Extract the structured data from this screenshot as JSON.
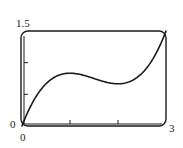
{
  "chart_data": {
    "type": "line",
    "title": "",
    "xlabel": "",
    "ylabel": "",
    "xlim": [
      0,
      3
    ],
    "ylim": [
      0,
      1.5
    ],
    "grid": false,
    "legend": null,
    "x_tick_labels": [
      "0",
      "3"
    ],
    "y_tick_labels": [
      "0",
      "1.5"
    ],
    "x_ticks": [
      1,
      2
    ],
    "y_ticks": [
      0.5,
      1.0
    ],
    "series": [
      {
        "name": "y = x^3/3 - 1.5x^2 + 2x",
        "x": [
          0,
          0.25,
          0.5,
          0.75,
          1.0,
          1.25,
          1.5,
          1.75,
          2.0,
          2.25,
          2.5,
          2.75,
          3.0
        ],
        "y": [
          0,
          0.411,
          0.667,
          0.797,
          0.833,
          0.807,
          0.75,
          0.693,
          0.667,
          0.703,
          0.833,
          1.089,
          1.5
        ]
      }
    ]
  },
  "labels": {
    "y_max": "1.5",
    "y_min": "0",
    "x_min": "0",
    "x_max": "3"
  },
  "colors": {
    "line": "#1a1a1a",
    "frame": "#1a1a1a",
    "background": "#ffffff"
  }
}
